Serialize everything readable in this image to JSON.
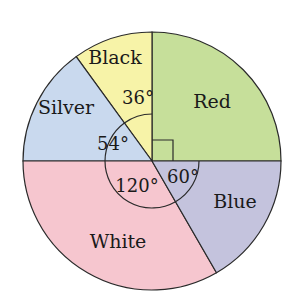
{
  "chart_data": {
    "type": "pie",
    "title": "",
    "unit": "degrees",
    "categories": [
      "Red",
      "Black",
      "Silver",
      "White",
      "Blue"
    ],
    "values": [
      90,
      36,
      54,
      120,
      60
    ],
    "angle_labels": [
      "",
      "36°",
      "54°",
      "120°",
      "60°"
    ],
    "right_angle_marker_on": "Red",
    "colors": {
      "Red": "#c6df9a",
      "Black": "#f7f3a8",
      "Silver": "#c9d9ee",
      "White": "#f6c6cf",
      "Blue": "#c4c3dd"
    },
    "outline_color": "#2a2a2a"
  }
}
